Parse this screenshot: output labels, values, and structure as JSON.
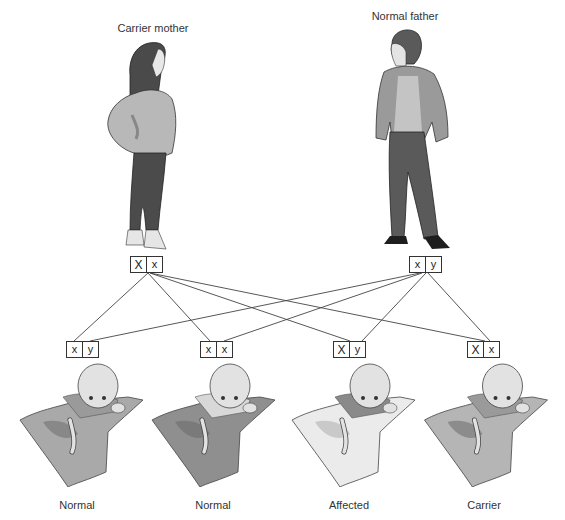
{
  "parents": {
    "mother": {
      "label": "Carrier mother",
      "genotype": [
        "X",
        "x"
      ]
    },
    "father": {
      "label": "Normal father",
      "genotype": [
        "x",
        "y"
      ]
    }
  },
  "children": [
    {
      "label": "Normal",
      "genotype": [
        "x",
        "y"
      ],
      "blanket_color": "#a9a9a9"
    },
    {
      "label": "Normal",
      "genotype": [
        "x",
        "x"
      ],
      "blanket_color": "#8f8f8f"
    },
    {
      "label": "Affected",
      "genotype": [
        "X",
        "y"
      ],
      "blanket_color": "#e8e8e8"
    },
    {
      "label": "Carrier",
      "genotype": [
        "X",
        "x"
      ],
      "blanket_color": "#b5b5b5"
    }
  ],
  "colors": {
    "line": "#444444",
    "box_border": "#333333"
  }
}
